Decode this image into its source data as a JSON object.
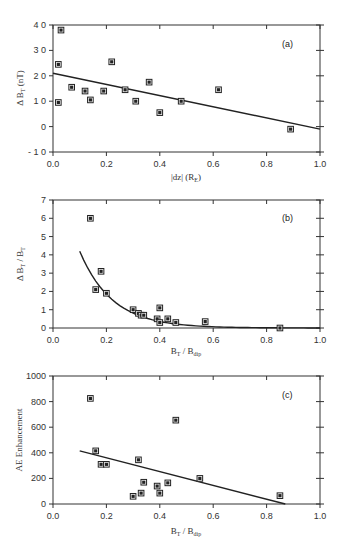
{
  "chart_data": [
    {
      "type": "scatter",
      "panel_label": "(a)",
      "title": "",
      "xlabel": "|dz| (R_E)",
      "xlabel_main": "|dz|  (R",
      "xlabel_sub": "E",
      "xlabel_tail": ")",
      "ylabel": "ΔB_T (nT)",
      "ylabel_main": "Δ B",
      "ylabel_sub": "T",
      "ylabel_tail": " (nT)",
      "xlim": [
        0.0,
        1.0
      ],
      "ylim": [
        -10,
        40
      ],
      "xticks": [
        "0.0",
        "0.2",
        "0.4",
        "0.6",
        "0.8",
        "1.0"
      ],
      "xtick_values": [
        0.0,
        0.2,
        0.4,
        0.6,
        0.8,
        1.0
      ],
      "yticks": [
        "4 0",
        "3 0",
        "2 0",
        "1 0",
        "0",
        "- 1 0"
      ],
      "ytick_values": [
        40,
        30,
        20,
        10,
        0,
        -10
      ],
      "grid": false,
      "points": {
        "x": [
          0.02,
          0.02,
          0.03,
          0.07,
          0.12,
          0.14,
          0.19,
          0.22,
          0.27,
          0.31,
          0.36,
          0.4,
          0.48,
          0.62,
          0.89
        ],
        "y": [
          9.5,
          24.5,
          38,
          15.5,
          14,
          10.5,
          14,
          25.5,
          14.5,
          10,
          17.5,
          5.5,
          10,
          14.5,
          -1
        ]
      },
      "fit": {
        "kind": "linear",
        "x": [
          0.0,
          1.0
        ],
        "y": [
          21,
          -1
        ]
      }
    },
    {
      "type": "scatter",
      "panel_label": "(b)",
      "title": "",
      "xlabel": "B_T / B_dip",
      "xlabel_main": "B",
      "xlabel_sub": "T",
      "xlabel_mid": " / B",
      "xlabel_sub2": "dip",
      "ylabel": "ΔB_T / B_T",
      "ylabel_main": "Δ B",
      "ylabel_sub": "T",
      "ylabel_mid": " / B",
      "ylabel_sub2": "T",
      "xlim": [
        0.0,
        1.0
      ],
      "ylim": [
        0,
        7
      ],
      "xticks": [
        "0.0",
        "0.2",
        "0.4",
        "0.6",
        "0.8",
        "1.0"
      ],
      "xtick_values": [
        0.0,
        0.2,
        0.4,
        0.6,
        0.8,
        1.0
      ],
      "yticks": [
        "7",
        "6",
        "5",
        "4",
        "3",
        "2",
        "1",
        "0"
      ],
      "ytick_values": [
        7,
        6,
        5,
        4,
        3,
        2,
        1,
        0
      ],
      "grid": false,
      "points": {
        "x": [
          0.14,
          0.16,
          0.18,
          0.2,
          0.3,
          0.32,
          0.33,
          0.34,
          0.39,
          0.4,
          0.4,
          0.43,
          0.46,
          0.57,
          0.85
        ],
        "y": [
          6.0,
          2.1,
          3.1,
          1.9,
          1.0,
          0.8,
          0.7,
          0.7,
          0.5,
          0.3,
          1.1,
          0.5,
          0.3,
          0.35,
          0.0
        ]
      },
      "fit": {
        "kind": "exponential-decay",
        "x_start": 0.1,
        "x_end": 1.0,
        "y_at_start": 4.2,
        "decay_rate": 8.2
      }
    },
    {
      "type": "scatter",
      "panel_label": "(c)",
      "title": "",
      "xlabel": "B_T / B_dip",
      "xlabel_main": "B",
      "xlabel_sub": "T",
      "xlabel_mid": " / B",
      "xlabel_sub2": "dip",
      "ylabel": "AE Enhancement",
      "xlim": [
        0.0,
        1.0
      ],
      "ylim": [
        0,
        1000
      ],
      "xticks": [
        "0.0",
        "0.2",
        "0.4",
        "0.6",
        "0.8",
        "1.0"
      ],
      "xtick_values": [
        0.0,
        0.2,
        0.4,
        0.6,
        0.8,
        1.0
      ],
      "yticks": [
        "1000",
        "800",
        "600",
        "400",
        "200",
        "0"
      ],
      "ytick_values": [
        1000,
        800,
        600,
        400,
        200,
        0
      ],
      "grid": false,
      "points": {
        "x": [
          0.14,
          0.16,
          0.18,
          0.2,
          0.3,
          0.32,
          0.33,
          0.34,
          0.39,
          0.4,
          0.43,
          0.46,
          0.55,
          0.85
        ],
        "y": [
          825,
          415,
          310,
          310,
          60,
          345,
          85,
          170,
          140,
          85,
          165,
          655,
          200,
          65
        ]
      },
      "fit": {
        "kind": "linear",
        "x": [
          0.1,
          0.87
        ],
        "y": [
          415,
          0
        ]
      }
    }
  ]
}
